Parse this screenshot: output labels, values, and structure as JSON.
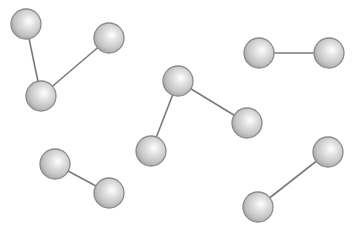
{
  "diagram": {
    "title": "",
    "width": 353,
    "height": 230,
    "colors": {
      "background": "#ffffff",
      "bond": "#7a7a7a",
      "sphere_edge": "#8a8a8a",
      "sphere_highlight": "#ffffff",
      "sphere_mid": "#d6d6d6",
      "sphere_shadow": "#a8a8a8"
    },
    "sphere_radius": 15,
    "molecules": [
      {
        "name": "triatomic-left",
        "atoms": [
          {
            "x": 26,
            "y": 24
          },
          {
            "x": 41,
            "y": 96
          },
          {
            "x": 109,
            "y": 38
          }
        ],
        "bonds": [
          [
            0,
            1
          ],
          [
            1,
            2
          ]
        ]
      },
      {
        "name": "triatomic-center",
        "atoms": [
          {
            "x": 178,
            "y": 81
          },
          {
            "x": 151,
            "y": 151
          },
          {
            "x": 247,
            "y": 123
          }
        ],
        "bonds": [
          [
            0,
            1
          ],
          [
            0,
            2
          ]
        ]
      },
      {
        "name": "diatomic-top-right",
        "atoms": [
          {
            "x": 259,
            "y": 53
          },
          {
            "x": 329,
            "y": 53
          }
        ],
        "bonds": [
          [
            0,
            1
          ]
        ]
      },
      {
        "name": "diatomic-bottom-left",
        "atoms": [
          {
            "x": 55,
            "y": 164
          },
          {
            "x": 109,
            "y": 193
          }
        ],
        "bonds": [
          [
            0,
            1
          ]
        ]
      },
      {
        "name": "diatomic-bottom-right",
        "atoms": [
          {
            "x": 328,
            "y": 152
          },
          {
            "x": 258,
            "y": 207
          }
        ],
        "bonds": [
          [
            0,
            1
          ]
        ]
      }
    ]
  }
}
